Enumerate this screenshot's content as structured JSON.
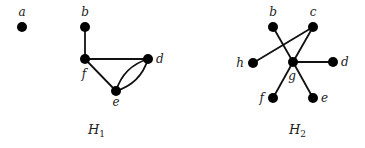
{
  "graphs": [
    {
      "id": "H1",
      "caption": "H",
      "caption_sub": "1",
      "caption_pos": [
        88,
        134
      ],
      "nodes": [
        {
          "id": "a",
          "label": "a",
          "x": 22,
          "y": 27,
          "lx": 22,
          "ly": 16,
          "anchor": "middle"
        },
        {
          "id": "b",
          "label": "b",
          "x": 85,
          "y": 27,
          "lx": 85,
          "ly": 16,
          "anchor": "middle"
        },
        {
          "id": "f",
          "label": "f",
          "x": 85,
          "y": 59,
          "lx": 84,
          "ly": 78,
          "anchor": "middle"
        },
        {
          "id": "d",
          "label": "d",
          "x": 148,
          "y": 59,
          "lx": 156,
          "ly": 63,
          "anchor": "start"
        },
        {
          "id": "e",
          "label": "e",
          "x": 116,
          "y": 91,
          "lx": 116,
          "ly": 106,
          "anchor": "middle"
        }
      ],
      "edges": [
        {
          "from": "b",
          "to": "f",
          "type": "line"
        },
        {
          "from": "f",
          "to": "d",
          "type": "line"
        },
        {
          "from": "f",
          "to": "e",
          "type": "line"
        },
        {
          "from": "e",
          "to": "d",
          "type": "curve",
          "bend": 1
        },
        {
          "from": "e",
          "to": "d",
          "type": "curve",
          "bend": -1
        }
      ]
    },
    {
      "id": "H2",
      "caption": "H",
      "caption_sub": "2",
      "caption_pos": [
        289,
        134
      ],
      "nodes": [
        {
          "id": "b",
          "label": "b",
          "x": 273,
          "y": 27,
          "lx": 273,
          "ly": 16,
          "anchor": "middle"
        },
        {
          "id": "c",
          "label": "c",
          "x": 313,
          "y": 27,
          "lx": 313,
          "ly": 16,
          "anchor": "middle"
        },
        {
          "id": "h",
          "label": "h",
          "x": 253,
          "y": 63,
          "lx": 244,
          "ly": 67,
          "anchor": "end"
        },
        {
          "id": "g",
          "label": "g",
          "x": 293,
          "y": 62,
          "lx": 292,
          "ly": 80,
          "anchor": "middle"
        },
        {
          "id": "d",
          "label": "d",
          "x": 333,
          "y": 62,
          "lx": 341,
          "ly": 66,
          "anchor": "start"
        },
        {
          "id": "f",
          "label": "f",
          "x": 273,
          "y": 98,
          "lx": 264,
          "ly": 102,
          "anchor": "end"
        },
        {
          "id": "e",
          "label": "e",
          "x": 313,
          "y": 98,
          "lx": 321,
          "ly": 102,
          "anchor": "start"
        }
      ],
      "edges": [
        {
          "from": "h",
          "to": "c",
          "type": "line"
        },
        {
          "from": "c",
          "to": "g",
          "type": "line"
        },
        {
          "from": "b",
          "to": "g",
          "type": "line"
        },
        {
          "from": "g",
          "to": "e",
          "type": "line"
        },
        {
          "from": "g",
          "to": "d",
          "type": "line"
        },
        {
          "from": "g",
          "to": "f",
          "type": "line"
        }
      ]
    }
  ]
}
